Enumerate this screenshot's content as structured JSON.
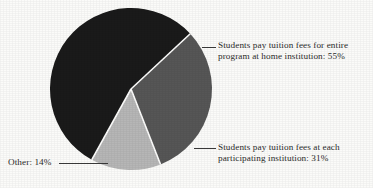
{
  "chart_data": {
    "type": "pie",
    "title": "",
    "subtitle": "",
    "xlabel": "",
    "ylabel": "",
    "legend_position": "callout-labels",
    "grid": false,
    "categories": [
      "Students pay tuition fees for entire program at home institution",
      "Students pay tuition fees at each participating institution",
      "Other"
    ],
    "values": [
      55,
      31,
      14
    ],
    "value_unit": "%",
    "slices": [
      {
        "label": "Students pay tuition fees for entire program at home institution: 55%",
        "label_line1": "Students pay tuition fees for entire",
        "label_line2": "program at home institution: 55%",
        "category": "Students pay tuition fees for entire program at home institution",
        "value": 55,
        "value_text": "55%",
        "color": "#1a1a1a",
        "label_position": "right-top"
      },
      {
        "label": "Students pay tuition fees at each participating institution: 31%",
        "label_line1": "Students pay tuition fees at each",
        "label_line2": "participating institution: 31%",
        "category": "Students pay tuition fees at each participating institution",
        "value": 31,
        "value_text": "31%",
        "color": "#565656",
        "label_position": "right-bottom"
      },
      {
        "label": "Other: 14%",
        "label_line1": "Other: 14%",
        "label_line2": "",
        "category": "Other",
        "value": 14,
        "value_text": "14%",
        "color": "#b6b6b6",
        "label_position": "left-bottom"
      }
    ]
  },
  "colors": {
    "background": "#fbfbf9",
    "text": "#2c2c2c",
    "slice_dark": "#1a1a1a",
    "slice_medium": "#565656",
    "slice_light": "#b6b6b6",
    "slice_separator": "#ffffff",
    "leader_line": "#3a3a3a"
  }
}
